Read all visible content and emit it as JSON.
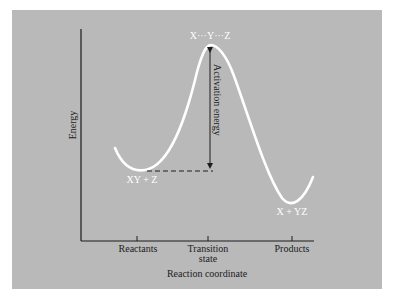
{
  "figure": {
    "title": "",
    "x_axis_label": "Reaction coordinate",
    "y_axis_label": "Energy",
    "ticks": [
      {
        "label": "Reactants",
        "label2": ""
      },
      {
        "label": "Transition",
        "label2": "state"
      },
      {
        "label": "Products",
        "label2": ""
      }
    ],
    "annotations": {
      "transition_state": "X···Y···Z",
      "reactants": "XY + Z",
      "products": "X + YZ",
      "activation_energy": "Activation energy"
    },
    "colors": {
      "panel": "#b9b9b9",
      "curve": "#ffffff",
      "axis": "#1c1c1c"
    }
  }
}
